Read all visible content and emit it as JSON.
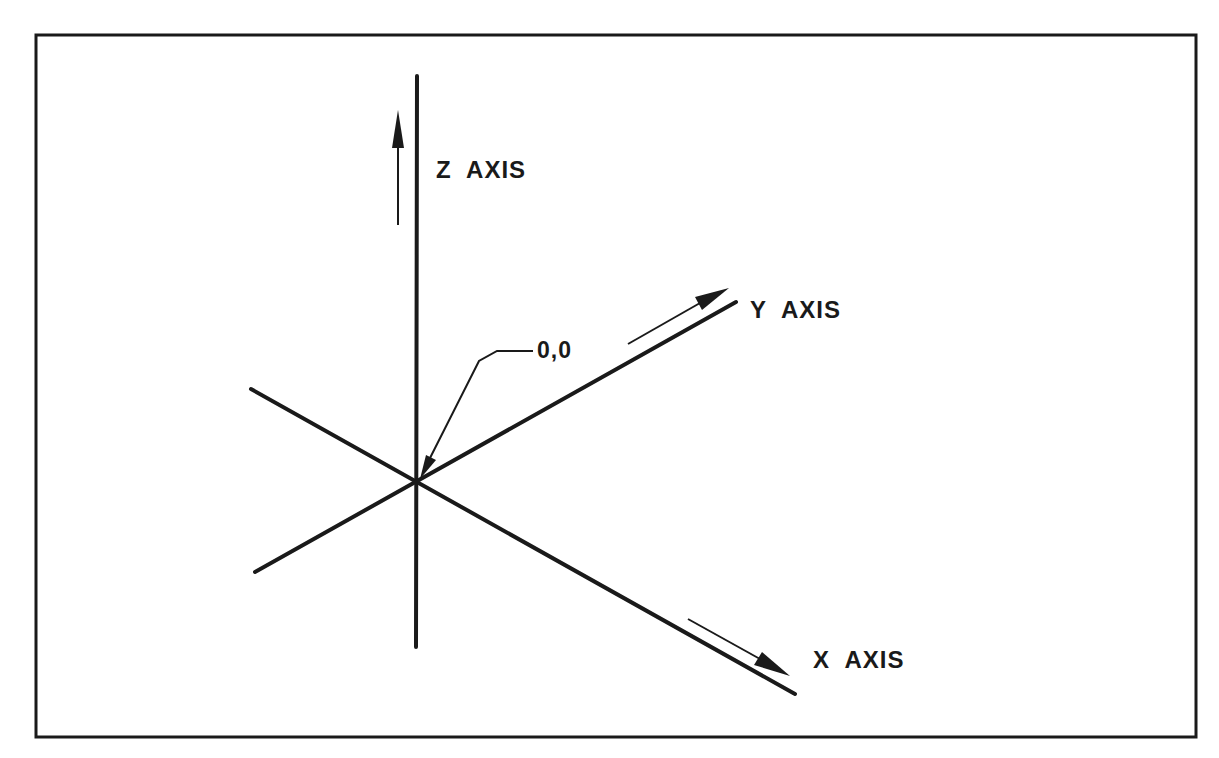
{
  "diagram": {
    "type": "3d-coordinate-axes",
    "labels": {
      "z_axis": "Z  AXIS",
      "y_axis": "Y  AXIS",
      "x_axis": "X  AXIS",
      "origin": "0,0"
    },
    "colors": {
      "line": "#1a1a1a",
      "background": "#ffffff"
    }
  }
}
